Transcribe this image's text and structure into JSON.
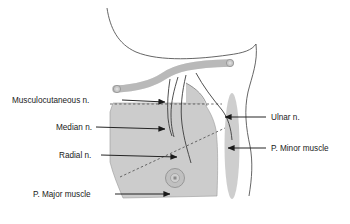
{
  "figure": {
    "background_color": "#ffffff",
    "outline_color": "#555555",
    "muscle_fill": "#cccccc",
    "bone_fill": "#c8c8c8",
    "leader_color": "#1a1a1a",
    "text_color": "#1a1a1a"
  },
  "labels": {
    "musculocutaneous": "Musculocutaneous n.",
    "median": "Median n.",
    "radial": "Radial n.",
    "pmajor": "P. Major muscle",
    "ulnar": "Ulnar n.",
    "pminor": "P. Minor muscle"
  },
  "structures": {
    "clavicle": "clavicle-bone",
    "pectoralis_major": "pectoralis-major-muscle",
    "pectoralis_minor": "pectoralis-minor-muscle",
    "nipple": "nipple-areola",
    "body_outline": "torso-outline",
    "nerve_musculocutaneous": "musculocutaneous-nerve-path",
    "nerve_median": "median-nerve-path",
    "nerve_radial": "radial-nerve-path",
    "nerve_ulnar": "ulnar-nerve-path",
    "dashed_horizontal": "horizontal-reference-line",
    "dashed_diagonal": "diagonal-reference-line"
  }
}
